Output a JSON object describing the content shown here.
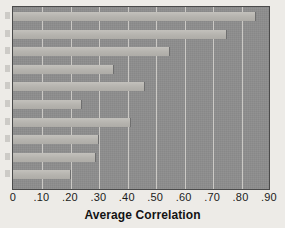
{
  "chart_data": {
    "type": "bar",
    "orientation": "horizontal",
    "title": "",
    "subtitle": "",
    "xlabel": "Average Correlation",
    "ylabel": "",
    "xlim": [
      0,
      0.9
    ],
    "grid": true,
    "legend": null,
    "xticks": [
      "0",
      ".10",
      ".20",
      ".30",
      ".40",
      ".50",
      ".60",
      ".70",
      ".80",
      ".90"
    ],
    "xtick_values": [
      0,
      0.1,
      0.2,
      0.3,
      0.4,
      0.5,
      0.6,
      0.7,
      0.8,
      0.9
    ],
    "categories": [
      "",
      "",
      "",
      "",
      "",
      "",
      "",
      "",
      "",
      ""
    ],
    "values": [
      0.85,
      0.75,
      0.55,
      0.35,
      0.46,
      0.24,
      0.41,
      0.3,
      0.29,
      0.2
    ],
    "bar_count": 10,
    "colors": {
      "plot_background": "#8d8d8d",
      "bar_fill": "#b9b7b2",
      "gridline": "#d6d4cf",
      "frame_border": "#4a4a4a",
      "page_background": "#edebe7",
      "text": "#1b1b1b"
    }
  },
  "axis": {
    "x_title": "Average Correlation"
  }
}
